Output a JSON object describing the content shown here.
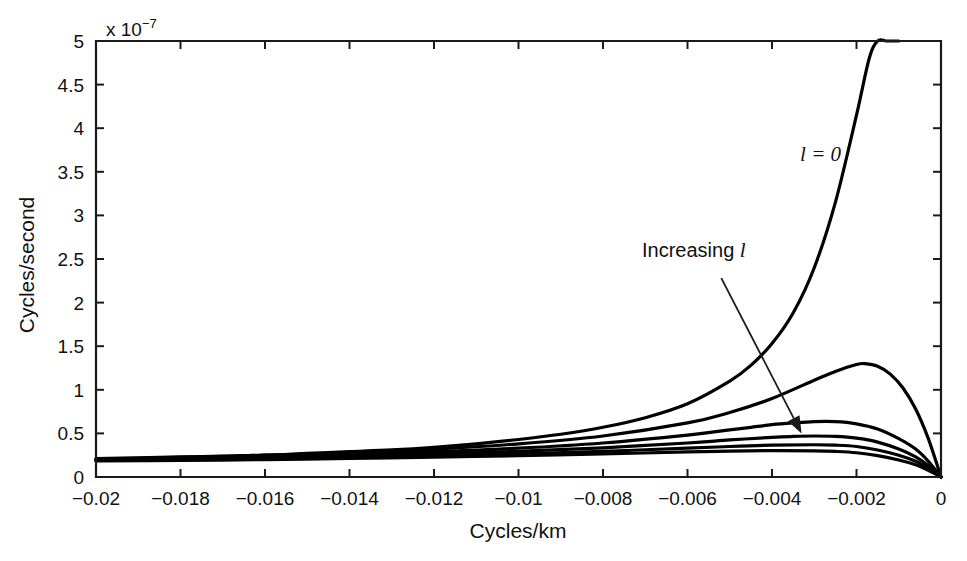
{
  "chart_data": {
    "type": "line",
    "title": "",
    "xlabel": "Cycles/km",
    "ylabel": "Cycles/second",
    "y_exponent_prefix": "x 10",
    "y_exponent_power": "-7",
    "xlim": [
      -0.02,
      0
    ],
    "ylim": [
      0,
      5e-07
    ],
    "ylim_scaled": [
      0,
      5
    ],
    "grid": false,
    "legend": "none",
    "x_ticks": [
      -0.02,
      -0.018,
      -0.016,
      -0.014,
      -0.012,
      -0.01,
      -0.008,
      -0.006,
      -0.004,
      -0.002,
      0
    ],
    "x_tick_labels": [
      "-0.02",
      "-0.018",
      "-0.016",
      "-0.014",
      "-0.012",
      "-0.01",
      "-0.008",
      "-0.006",
      "-0.004",
      "-0.002",
      "0"
    ],
    "y_ticks": [
      0,
      0.5,
      1,
      1.5,
      2,
      2.5,
      3,
      3.5,
      4,
      4.5,
      5
    ],
    "y_tick_labels": [
      "0",
      "0.5",
      "1",
      "1.5",
      "2",
      "2.5",
      "3",
      "3.5",
      "4",
      "4.5",
      "5"
    ],
    "annotations": [
      {
        "name": "curve-label-l-zero",
        "text": "l = 0",
        "x": -0.00285,
        "y": 3.62
      },
      {
        "name": "increasing-l-label",
        "text": "Increasing",
        "italic_suffix": "l",
        "x": -0.00585,
        "y": 2.52
      }
    ],
    "arrow": {
      "from": {
        "x": -0.0052,
        "y": 2.28
      },
      "to": {
        "x": -0.0033,
        "y": 0.5
      }
    },
    "series": [
      {
        "name": "l = 0",
        "label": "l = 0",
        "x": [
          -0.02,
          -0.019,
          -0.018,
          -0.017,
          -0.016,
          -0.015,
          -0.014,
          -0.013,
          -0.012,
          -0.011,
          -0.01,
          -0.009,
          -0.008,
          -0.007,
          -0.006,
          -0.005,
          -0.0045,
          -0.004,
          -0.0035,
          -0.003,
          -0.0025,
          -0.002,
          -0.0017,
          -0.0015,
          -0.0013,
          -0.0011,
          -0.001
        ],
        "values": [
          0.21,
          0.22,
          0.23,
          0.24,
          0.25,
          0.27,
          0.29,
          0.31,
          0.34,
          0.38,
          0.43,
          0.49,
          0.57,
          0.68,
          0.84,
          1.1,
          1.28,
          1.53,
          1.88,
          2.4,
          3.15,
          4.15,
          4.8,
          5.0,
          5.0,
          5.0,
          5.0
        ]
      },
      {
        "name": "l = 1",
        "x": [
          -0.02,
          -0.018,
          -0.016,
          -0.014,
          -0.012,
          -0.01,
          -0.008,
          -0.006,
          -0.005,
          -0.004,
          -0.003,
          -0.0025,
          -0.002,
          -0.0018,
          -0.0015,
          -0.0012,
          -0.0009,
          -0.0006,
          -0.0003,
          0
        ],
        "values": [
          0.205,
          0.225,
          0.25,
          0.28,
          0.32,
          0.38,
          0.47,
          0.62,
          0.74,
          0.9,
          1.11,
          1.21,
          1.29,
          1.3,
          1.27,
          1.18,
          1.02,
          0.78,
          0.44,
          0.0
        ]
      },
      {
        "name": "l = 2",
        "x": [
          -0.02,
          -0.018,
          -0.016,
          -0.014,
          -0.012,
          -0.01,
          -0.008,
          -0.006,
          -0.005,
          -0.0045,
          -0.004,
          -0.0035,
          -0.003,
          -0.0025,
          -0.002,
          -0.0015,
          -0.001,
          -0.0006,
          -0.0003,
          0
        ],
        "values": [
          0.2,
          0.215,
          0.235,
          0.26,
          0.29,
          0.33,
          0.39,
          0.48,
          0.54,
          0.57,
          0.6,
          0.62,
          0.635,
          0.635,
          0.61,
          0.55,
          0.44,
          0.32,
          0.18,
          0.0
        ]
      },
      {
        "name": "l = 3",
        "x": [
          -0.02,
          -0.018,
          -0.016,
          -0.014,
          -0.012,
          -0.01,
          -0.008,
          -0.006,
          -0.005,
          -0.004,
          -0.0035,
          -0.003,
          -0.0025,
          -0.002,
          -0.0015,
          -0.001,
          -0.0006,
          -0.0003,
          0
        ],
        "values": [
          0.195,
          0.205,
          0.22,
          0.24,
          0.265,
          0.295,
          0.335,
          0.39,
          0.425,
          0.455,
          0.465,
          0.47,
          0.465,
          0.445,
          0.4,
          0.32,
          0.23,
          0.13,
          0.0
        ]
      },
      {
        "name": "l = 4",
        "x": [
          -0.02,
          -0.018,
          -0.016,
          -0.014,
          -0.012,
          -0.01,
          -0.008,
          -0.006,
          -0.005,
          -0.004,
          -0.003,
          -0.0025,
          -0.002,
          -0.0015,
          -0.001,
          -0.0006,
          -0.0003,
          0
        ],
        "values": [
          0.19,
          0.198,
          0.21,
          0.225,
          0.245,
          0.265,
          0.295,
          0.33,
          0.35,
          0.365,
          0.37,
          0.365,
          0.35,
          0.31,
          0.25,
          0.18,
          0.1,
          0.0
        ]
      },
      {
        "name": "l = 5",
        "x": [
          -0.02,
          -0.018,
          -0.016,
          -0.014,
          -0.012,
          -0.01,
          -0.008,
          -0.006,
          -0.005,
          -0.004,
          -0.003,
          -0.0025,
          -0.002,
          -0.0015,
          -0.001,
          -0.0006,
          -0.0003,
          0
        ],
        "values": [
          0.185,
          0.19,
          0.2,
          0.212,
          0.228,
          0.245,
          0.265,
          0.287,
          0.297,
          0.303,
          0.3,
          0.293,
          0.278,
          0.245,
          0.195,
          0.14,
          0.078,
          0.0
        ]
      }
    ]
  }
}
